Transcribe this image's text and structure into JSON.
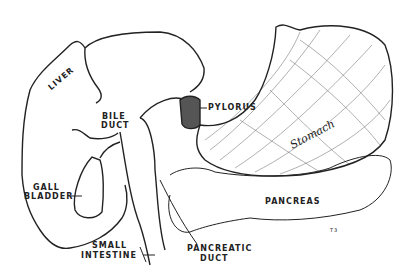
{
  "diagram": {
    "type": "anatomical-illustration",
    "labels": {
      "liver": "LIVER",
      "bile_duct_1": "BILE",
      "bile_duct_2": "DUCT",
      "pylorus": "PYLORUS",
      "stomach": "Stomach",
      "gall_bladder_1": "GALL",
      "gall_bladder_2": "BLADDER",
      "pancreas": "PANCREAS",
      "small_intestine_1": "SMALL",
      "small_intestine_2": "INTESTINE",
      "pancreatic_duct_1": "PANCREATIC",
      "pancreatic_duct_2": "DUCT",
      "signature": "T3"
    },
    "colors": {
      "ink": "#222222",
      "background": "#ffffff"
    }
  }
}
